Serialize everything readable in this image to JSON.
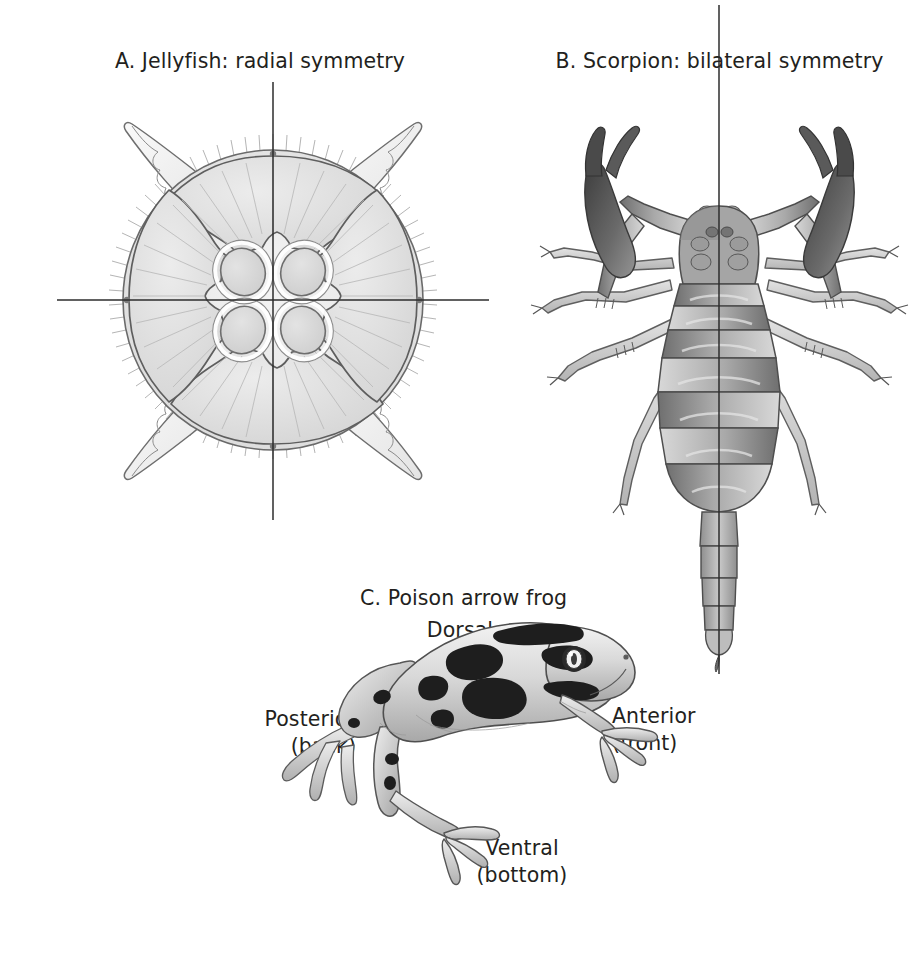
{
  "figure": {
    "background_color": "#ffffff",
    "ink_color": "#231f20",
    "panels": [
      {
        "id": "jellyfish",
        "caption": "A. Jellyfish: radial symmetry",
        "organism": "jellyfish",
        "symmetry_type": "radial",
        "view": "top-down (aboral)",
        "axis_count": 2,
        "axes": [
          "vertical",
          "horizontal"
        ],
        "features": [
          "four oral arms",
          "four horseshoe gonads",
          "ciliated bell margin"
        ]
      },
      {
        "id": "scorpion",
        "caption": "B. Scorpion: bilateral symmetry",
        "organism": "scorpion",
        "symmetry_type": "bilateral",
        "view": "dorsal",
        "axis_count": 1,
        "axes": [
          "vertical"
        ],
        "features": [
          "two pedipalps with pincers",
          "eight walking legs",
          "segmented mesosoma",
          "metasoma tail",
          "telson stinger"
        ]
      },
      {
        "id": "frog",
        "caption": "C. Poison arrow frog",
        "organism": "poison arrow frog",
        "symmetry_type": "bilateral",
        "view": "lateral",
        "axis_count": 0,
        "axes": [],
        "features": [
          "dark blotches on pale body",
          "hind leg folded",
          "forelimb extended"
        ]
      }
    ]
  },
  "panel_a": {
    "caption": "A. Jellyfish: radial symmetry"
  },
  "panel_b": {
    "caption": "B. Scorpion: bilateral symmetry"
  },
  "panel_c": {
    "caption": "C. Poison arrow frog",
    "directions": {
      "dorsal": {
        "term": "Dorsal",
        "plain": "(top)"
      },
      "ventral": {
        "term": "Ventral",
        "plain": "(bottom)"
      },
      "anterior": {
        "term": "Anterior",
        "plain": "(front)"
      },
      "posterior": {
        "term": "Posterior",
        "plain": "(back)"
      }
    }
  }
}
